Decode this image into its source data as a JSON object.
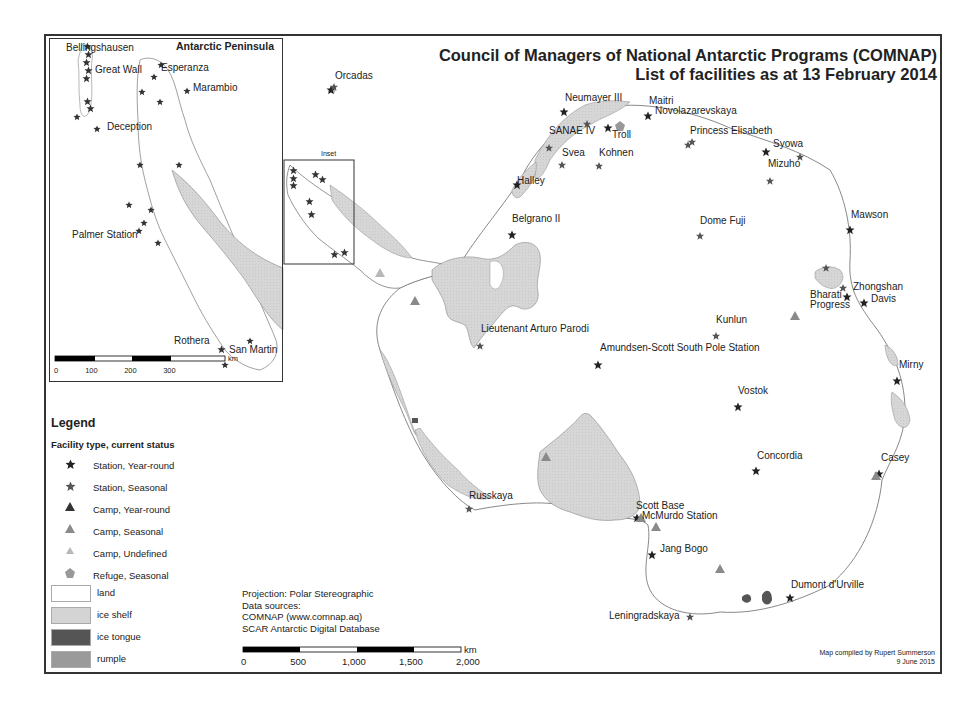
{
  "title": {
    "line1": "Council of Managers of National Antarctic Programs (COMNAP)",
    "line2": "List of facilities as at 13 February 2014"
  },
  "colors": {
    "land": "#ffffff",
    "ice_shelf": "#d4d4d4",
    "ice_tongue": "#555555",
    "rumple": "#9a9a9a",
    "coastline": "#7a7a7a",
    "station_year_round": "#222222",
    "station_seasonal": "#555555",
    "camp_year_round": "#333333",
    "camp_seasonal": "#8a8a8a",
    "camp_undefined": "#b8b8b8",
    "refuge_seasonal": "#999999",
    "frame": "#333333"
  },
  "inset": {
    "title": "Antarctic Peninsula",
    "locator_label": "Inset",
    "labels": [
      {
        "name": "Bellingshausen",
        "x": 66,
        "y": 48
      },
      {
        "name": "Great Wall",
        "x": 95,
        "y": 70
      },
      {
        "name": "Esperanza",
        "x": 161,
        "y": 68
      },
      {
        "name": "Marambio",
        "x": 193,
        "y": 88
      },
      {
        "name": "Deception",
        "x": 107,
        "y": 127
      },
      {
        "name": "Palmer Station",
        "x": 72,
        "y": 235
      },
      {
        "name": "Rothera",
        "x": 174,
        "y": 341
      },
      {
        "name": "San Martin",
        "x": 229,
        "y": 350
      }
    ],
    "scalebar": {
      "unit": "km",
      "ticks": [
        "0",
        "100",
        "200",
        "300"
      ]
    }
  },
  "labels": [
    {
      "name": "Orcadas",
      "x": 335,
      "y": 76
    },
    {
      "name": "Neumayer III",
      "x": 565,
      "y": 98
    },
    {
      "name": "Maitri",
      "x": 649,
      "y": 101
    },
    {
      "name": "Novolazarevskaya",
      "x": 655,
      "y": 111
    },
    {
      "name": "SANAE IV",
      "x": 549,
      "y": 131
    },
    {
      "name": "Troll",
      "x": 612,
      "y": 135
    },
    {
      "name": "Princess Elisabeth",
      "x": 690,
      "y": 131
    },
    {
      "name": "Syowa",
      "x": 773,
      "y": 144
    },
    {
      "name": "Svea",
      "x": 562,
      "y": 153
    },
    {
      "name": "Kohnen",
      "x": 599,
      "y": 153
    },
    {
      "name": "Mizuho",
      "x": 768,
      "y": 164
    },
    {
      "name": "Halley",
      "x": 517,
      "y": 181
    },
    {
      "name": "Belgrano II",
      "x": 512,
      "y": 219
    },
    {
      "name": "Dome Fuji",
      "x": 700,
      "y": 221
    },
    {
      "name": "Mawson",
      "x": 851,
      "y": 215
    },
    {
      "name": "Zhongshan",
      "x": 853,
      "y": 287
    },
    {
      "name": "Bharati",
      "x": 810,
      "y": 295
    },
    {
      "name": "Davis",
      "x": 871,
      "y": 299
    },
    {
      "name": "Progress",
      "x": 810,
      "y": 305
    },
    {
      "name": "Kunlun",
      "x": 716,
      "y": 320
    },
    {
      "name": "Lieutenant Arturo Parodi",
      "x": 481,
      "y": 329
    },
    {
      "name": "Amundsen-Scott South Pole Station",
      "x": 600,
      "y": 348
    },
    {
      "name": "Mirny",
      "x": 899,
      "y": 365
    },
    {
      "name": "Vostok",
      "x": 738,
      "y": 391
    },
    {
      "name": "Concordia",
      "x": 757,
      "y": 456
    },
    {
      "name": "Casey",
      "x": 881,
      "y": 458
    },
    {
      "name": "Russkaya",
      "x": 469,
      "y": 496
    },
    {
      "name": "Scott Base",
      "x": 636,
      "y": 506
    },
    {
      "name": "McMurdo Station",
      "x": 642,
      "y": 516
    },
    {
      "name": "Jang Bogo",
      "x": 660,
      "y": 549
    },
    {
      "name": "Dumont d'Urville",
      "x": 791,
      "y": 585
    },
    {
      "name": "Leningradskaya",
      "x": 609,
      "y": 616
    }
  ],
  "stations_year_round": [
    [
      331,
      90
    ],
    [
      564,
      112
    ],
    [
      648,
      116
    ],
    [
      608,
      128
    ],
    [
      766,
      152
    ],
    [
      517,
      185
    ],
    [
      512,
      235
    ],
    [
      850,
      230
    ],
    [
      847,
      297
    ],
    [
      864,
      303
    ],
    [
      598,
      365
    ],
    [
      738,
      407
    ],
    [
      756,
      471
    ],
    [
      897,
      381
    ],
    [
      879,
      474
    ],
    [
      637,
      518
    ],
    [
      652,
      555
    ],
    [
      790,
      598
    ]
  ],
  "stations_seasonal": [
    [
      587,
      124
    ],
    [
      549,
      148
    ],
    [
      562,
      165
    ],
    [
      599,
      166
    ],
    [
      688,
      145
    ],
    [
      692,
      142
    ],
    [
      800,
      157
    ],
    [
      770,
      181
    ],
    [
      700,
      236
    ],
    [
      826,
      268
    ],
    [
      843,
      288
    ],
    [
      716,
      336
    ],
    [
      480,
      346
    ],
    [
      469,
      509
    ],
    [
      690,
      617
    ],
    [
      334,
      87
    ]
  ],
  "camps_year_round": [],
  "camps_seasonal": [
    [
      415,
      301
    ],
    [
      795,
      316
    ],
    [
      546,
      457
    ],
    [
      720,
      569
    ],
    [
      656,
      527
    ],
    [
      641,
      518
    ],
    [
      876,
      476
    ]
  ],
  "camps_undefined": [
    [
      380,
      273
    ]
  ],
  "refuges_seasonal": [
    [
      620,
      126
    ]
  ],
  "legend": {
    "title": "Legend",
    "subtitle": "Facility type, current status",
    "items": [
      {
        "symbol": "star-filled",
        "label": "Station, Year-round"
      },
      {
        "symbol": "star-outline",
        "label": "Station, Seasonal"
      },
      {
        "symbol": "triangle-dark",
        "label": "Camp, Year-round"
      },
      {
        "symbol": "triangle-mid",
        "label": "Camp, Seasonal"
      },
      {
        "symbol": "triangle-light",
        "label": "Camp, Undefined"
      },
      {
        "symbol": "pentagon",
        "label": "Refuge, Seasonal"
      }
    ],
    "surfaces": [
      {
        "label": "land"
      },
      {
        "label": "ice shelf"
      },
      {
        "label": "ice tongue"
      },
      {
        "label": "rumple"
      }
    ]
  },
  "info": {
    "projection": "Projection: Polar Stereographic",
    "sources_heading": "Data sources:",
    "source1": "COMNAP (www.comnap.aq)",
    "source2": "SCAR Antarctic Digital Database"
  },
  "scalebar": {
    "unit": "km",
    "ticks": [
      "0",
      "500",
      "1,000",
      "1,500",
      "2,000"
    ]
  },
  "credit": {
    "line1": "Map compiled by Rupert Summerson",
    "line2": "9 June 2015"
  }
}
